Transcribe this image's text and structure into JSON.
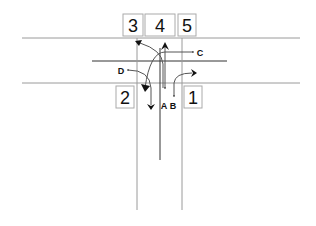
{
  "diagram": {
    "title": "",
    "zones": [
      {
        "id": "zone-1",
        "label": "1"
      },
      {
        "id": "zone-2",
        "label": "2"
      },
      {
        "id": "zone-3",
        "label": "3"
      },
      {
        "id": "zone-4",
        "label": "4"
      },
      {
        "id": "zone-5",
        "label": "5"
      }
    ],
    "movements": [
      {
        "id": "A",
        "label": "A",
        "description": "straight through to zone 4"
      },
      {
        "id": "B",
        "label": "B",
        "description": "right turn toward zone 1 side"
      },
      {
        "id": "C",
        "label": "C",
        "description": "left turn curving down toward zone 2"
      },
      {
        "id": "D",
        "label": "D",
        "description": "turn curving down into approach"
      }
    ]
  }
}
